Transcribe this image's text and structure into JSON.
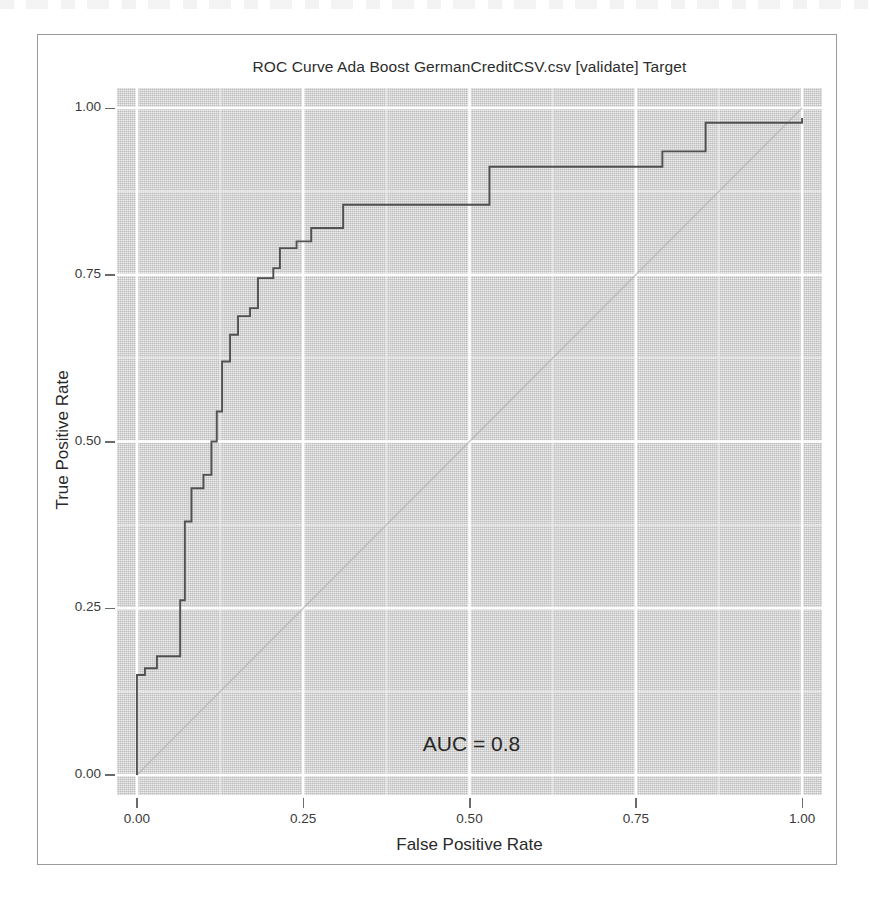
{
  "chart_data": {
    "type": "line",
    "title": "ROC Curve Ada Boost GermanCreditCSV.csv [validate] Target",
    "xlabel": "False Positive Rate",
    "ylabel": "True Positive Rate",
    "xlim": [
      -0.03,
      1.03
    ],
    "ylim": [
      -0.03,
      1.03
    ],
    "grid": true,
    "legend": null,
    "x_ticks": [
      "0.00",
      "0.25",
      "0.50",
      "0.75",
      "1.00"
    ],
    "x_tick_values": [
      0.0,
      0.25,
      0.5,
      0.75,
      1.0
    ],
    "y_ticks": [
      "0.00",
      "0.25",
      "0.50",
      "0.75",
      "1.00"
    ],
    "y_tick_values": [
      0.0,
      0.25,
      0.5,
      0.75,
      1.0
    ],
    "minor_grid_step": 0.125,
    "annotations": [
      {
        "text": "AUC = 0.8",
        "x": 0.52,
        "y": 0.04
      }
    ],
    "series": [
      {
        "name": "ROC curve",
        "style": "step",
        "color": "#4a4a4a",
        "x": [
          0.0,
          0.0,
          0.012,
          0.012,
          0.03,
          0.03,
          0.065,
          0.065,
          0.065,
          0.072,
          0.072,
          0.082,
          0.082,
          0.1,
          0.1,
          0.112,
          0.112,
          0.12,
          0.12,
          0.128,
          0.128,
          0.14,
          0.14,
          0.152,
          0.152,
          0.17,
          0.17,
          0.182,
          0.182,
          0.205,
          0.205,
          0.215,
          0.215,
          0.24,
          0.24,
          0.262,
          0.262,
          0.31,
          0.31,
          0.53,
          0.53,
          0.79,
          0.79,
          0.855,
          0.855,
          1.0,
          1.0
        ],
        "y": [
          0.0,
          0.15,
          0.15,
          0.16,
          0.16,
          0.178,
          0.178,
          0.18,
          0.262,
          0.262,
          0.38,
          0.38,
          0.43,
          0.43,
          0.45,
          0.45,
          0.5,
          0.5,
          0.545,
          0.545,
          0.62,
          0.62,
          0.66,
          0.66,
          0.688,
          0.688,
          0.7,
          0.7,
          0.745,
          0.745,
          0.76,
          0.76,
          0.79,
          0.79,
          0.8,
          0.8,
          0.82,
          0.82,
          0.855,
          0.855,
          0.912,
          0.912,
          0.935,
          0.935,
          0.978,
          0.978,
          0.985
        ]
      },
      {
        "name": "chance diagonal",
        "style": "line",
        "color": "#b0b0b0",
        "x": [
          0.0,
          1.0
        ],
        "y": [
          0.0,
          1.0
        ]
      }
    ]
  },
  "chart": {
    "title": "ROC Curve Ada Boost GermanCreditCSV.csv [validate] Target",
    "xlabel": "False Positive Rate",
    "ylabel": "True Positive Rate",
    "auc_label": "AUC = 0.8",
    "panel_color": "#d6d6d6",
    "grid_color": "#ffffff",
    "curve_color": "#4a4a4a",
    "diagonal_color": "#b0b0b0",
    "frame_color": "#9a9a9a"
  }
}
